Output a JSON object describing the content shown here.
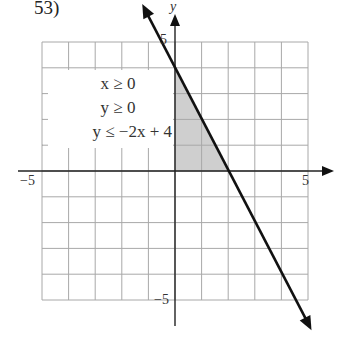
{
  "problem_label": "53)",
  "chart_data": {
    "type": "line",
    "title": "",
    "xlabel": "",
    "ylabel": "y",
    "xlim": [
      -5,
      5
    ],
    "ylim": [
      -5,
      5
    ],
    "grid": true,
    "tick_labels": {
      "x": [
        "−5",
        "5"
      ],
      "y": [
        "5",
        "−5"
      ]
    },
    "inequalities": [
      "x ≥ 0",
      "y ≥ 0",
      "y ≤ −2x + 4"
    ],
    "series": [
      {
        "name": "y = −2x + 4",
        "x": [
          -1.1,
          5.0
        ],
        "y": [
          6.2,
          -5.9
        ],
        "style": "solid bold, arrows both ends"
      }
    ],
    "shaded_region": {
      "vertices": [
        [
          0,
          0
        ],
        [
          0,
          4
        ],
        [
          2,
          0
        ]
      ],
      "fill": "#cfcfcf"
    }
  }
}
